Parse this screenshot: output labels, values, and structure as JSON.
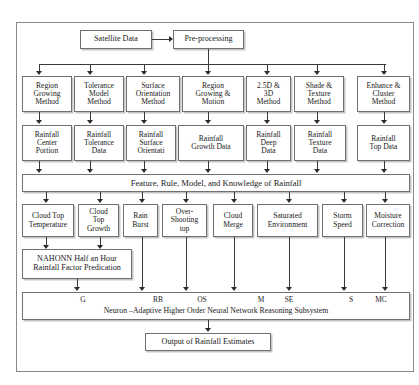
{
  "figure": {
    "cut_off_header": "",
    "caption_top": ""
  },
  "source": {
    "label": "Satellite Data"
  },
  "preprocess": {
    "label": "Pre-processing"
  },
  "methods": [
    {
      "label": "Region\nGrowing\nMethod"
    },
    {
      "label": "Tolerance\nModel\nMethod"
    },
    {
      "label": "Surface\nOrientation\nMethod"
    },
    {
      "label": "Region\nGrowing &\nMotion"
    },
    {
      "label": "2.5D &\n3D\nMethod"
    },
    {
      "label": "Shade &\nTexture\nMethod"
    },
    {
      "label": "Enhance &\nCluster\nMethod"
    }
  ],
  "rainfall_data": [
    {
      "label": "Rainfall\nCenter\nPortion"
    },
    {
      "label": "Rainfall\nTolerance\nData"
    },
    {
      "label": "Rainfall\nSurface\nOrientati"
    },
    {
      "label": "Rainfall\nGrowth Data"
    },
    {
      "label": "Rainfall\nDeep\nData"
    },
    {
      "label": "Rainfall\nTexture\nData"
    },
    {
      "label": "Rainfall\nTop Data"
    }
  ],
  "knowledge_bar": {
    "label": "Feature, Rule, Model, and Knowledge of Rainfall"
  },
  "factors": [
    {
      "label": "Cloud Top\nTemperature"
    },
    {
      "label": "Cloud\nTop\nGrowth"
    },
    {
      "label": "Rain\nBurst"
    },
    {
      "label": "Over-\nShooting\ntop"
    },
    {
      "label": "Cloud\nMerge"
    },
    {
      "label": "Saturated\nEnvironment"
    },
    {
      "label": "Storm\nSpeed"
    },
    {
      "label": "Moisture\nCorrection"
    }
  ],
  "nahonn": {
    "label": "NAHONN Half an Hour\nRainfall Factor Predication"
  },
  "subsystem": {
    "caption": "Neuron –Adaptive Higher Order Neural Network Reasoning Subsystem",
    "inputs": [
      {
        "code": "G"
      },
      {
        "code": "RB"
      },
      {
        "code": "OS"
      },
      {
        "code": "M"
      },
      {
        "code": "SE"
      },
      {
        "code": "S"
      },
      {
        "code": "MC"
      }
    ]
  },
  "output": {
    "label": "Output of Rainfall Estimates"
  },
  "colors": {
    "frame": "#8a8a8a",
    "box_border": "#707070",
    "connector": "#3a3a3a",
    "text": "#1a1a1a",
    "background": "#ffffff"
  }
}
